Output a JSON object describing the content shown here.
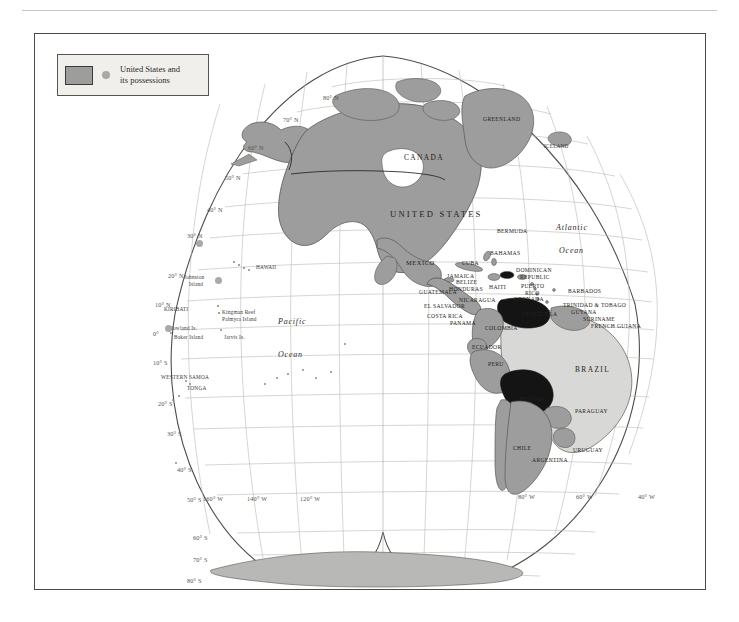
{
  "page": {
    "background": "#ffffff",
    "frame_color": "#4a4a48"
  },
  "legend": {
    "name": "map-legend",
    "swatch_color": "#9d9d9d",
    "dot_color": "#a8a8a8",
    "box_fill": "#f1efec",
    "line1": "United States and",
    "line2": "its possessions"
  },
  "map": {
    "projection": "interrupted-sinusoidal-globe",
    "land_color": "#9d9d9d",
    "land_light_color": "#d8d8d6",
    "highlight_color": "#141414",
    "graticule_color": "#b9b6b1",
    "coast_color": "#5a5753",
    "latitude_labels": [
      {
        "text": "80° N",
        "x": 288,
        "y": 60
      },
      {
        "text": "70° N",
        "x": 248,
        "y": 82
      },
      {
        "text": "60° N",
        "x": 213,
        "y": 110
      },
      {
        "text": "50° N",
        "x": 190,
        "y": 140
      },
      {
        "text": "40° N",
        "x": 172,
        "y": 172
      },
      {
        "text": "30° N",
        "x": 152,
        "y": 198
      },
      {
        "text": "20° N",
        "x": 133,
        "y": 238
      },
      {
        "text": "10° N",
        "x": 120,
        "y": 267
      },
      {
        "text": "0°",
        "x": 118,
        "y": 296
      },
      {
        "text": "10° S",
        "x": 118,
        "y": 325
      },
      {
        "text": "20° S",
        "x": 123,
        "y": 366
      },
      {
        "text": "30° S",
        "x": 132,
        "y": 396
      },
      {
        "text": "40° S",
        "x": 142,
        "y": 432
      },
      {
        "text": "50° S",
        "x": 152,
        "y": 462
      },
      {
        "text": "60° S",
        "x": 158,
        "y": 500
      },
      {
        "text": "70° S",
        "x": 158,
        "y": 522
      },
      {
        "text": "80° S",
        "x": 152,
        "y": 543
      }
    ],
    "longitude_labels": [
      {
        "text": "160° W",
        "x": 168,
        "y": 461
      },
      {
        "text": "140° W",
        "x": 212,
        "y": 461
      },
      {
        "text": "120° W",
        "x": 265,
        "y": 461
      },
      {
        "text": "80° W",
        "x": 483,
        "y": 459
      },
      {
        "text": "60° W",
        "x": 541,
        "y": 459
      },
      {
        "text": "40° W",
        "x": 603,
        "y": 459
      }
    ],
    "ocean_labels": [
      {
        "text": "Pacific",
        "x": 243,
        "y": 283
      },
      {
        "text": "Ocean",
        "x": 243,
        "y": 316
      },
      {
        "text": "Atlantic",
        "x": 521,
        "y": 189
      },
      {
        "text": "Ocean",
        "x": 524,
        "y": 212
      }
    ],
    "country_labels": [
      {
        "text": "CANADA",
        "x": 369,
        "y": 119,
        "style": "country-med"
      },
      {
        "text": "UNITED STATES",
        "x": 355,
        "y": 175,
        "style": "country-big"
      },
      {
        "text": "MEXICO",
        "x": 371,
        "y": 225,
        "style": "country"
      },
      {
        "text": "GREENLAND",
        "x": 448,
        "y": 82,
        "style": "country-sm"
      },
      {
        "text": "ICELAND",
        "x": 509,
        "y": 109,
        "style": "island"
      },
      {
        "text": "BERMUDA",
        "x": 462,
        "y": 194,
        "style": "country-sm"
      },
      {
        "text": "BAHAMAS",
        "x": 455,
        "y": 216,
        "style": "country-sm"
      },
      {
        "text": "CUBA",
        "x": 427,
        "y": 226,
        "style": "country-sm"
      },
      {
        "text": "JAMAICA",
        "x": 412,
        "y": 239,
        "style": "country-sm"
      },
      {
        "text": "BELIZE",
        "x": 421,
        "y": 245,
        "style": "country-sm"
      },
      {
        "text": "HONDURAS",
        "x": 414,
        "y": 252,
        "style": "country-sm"
      },
      {
        "text": "HAITI",
        "x": 454,
        "y": 250,
        "style": "country-sm"
      },
      {
        "text": "DOMINICAN",
        "x": 481,
        "y": 233,
        "style": "country-sm"
      },
      {
        "text": "REPUBLIC",
        "x": 485,
        "y": 240,
        "style": "country-sm"
      },
      {
        "text": "PUERTO",
        "x": 486,
        "y": 249,
        "style": "country-sm"
      },
      {
        "text": "RICO",
        "x": 490,
        "y": 256,
        "style": "country-sm"
      },
      {
        "text": "BARBADOS",
        "x": 533,
        "y": 254,
        "style": "country-sm"
      },
      {
        "text": "GRENADA",
        "x": 479,
        "y": 262,
        "style": "country-sm"
      },
      {
        "text": "TRINIDAD & TOBAGO",
        "x": 528,
        "y": 268,
        "style": "country-sm"
      },
      {
        "text": "GUATEMALA",
        "x": 384,
        "y": 255,
        "style": "country-sm"
      },
      {
        "text": "EL SALVADOR",
        "x": 389,
        "y": 269,
        "style": "country-sm"
      },
      {
        "text": "NICARAGUA",
        "x": 424,
        "y": 263,
        "style": "country-sm"
      },
      {
        "text": "COSTA RICA",
        "x": 392,
        "y": 279,
        "style": "country-sm"
      },
      {
        "text": "PANAMA",
        "x": 415,
        "y": 286,
        "style": "country-sm"
      },
      {
        "text": "VENEZUELA",
        "x": 486,
        "y": 277,
        "style": "country-sm"
      },
      {
        "text": "GUYANA",
        "x": 536,
        "y": 275,
        "style": "country-sm"
      },
      {
        "text": "SURINAME",
        "x": 548,
        "y": 282,
        "style": "country-sm"
      },
      {
        "text": "FRENCH GUIANA",
        "x": 556,
        "y": 289,
        "style": "country-sm"
      },
      {
        "text": "COLOMBIA",
        "x": 450,
        "y": 291,
        "style": "country-sm"
      },
      {
        "text": "ECUADOR",
        "x": 437,
        "y": 310,
        "style": "country-sm"
      },
      {
        "text": "PERU",
        "x": 453,
        "y": 327,
        "style": "country-sm"
      },
      {
        "text": "BRAZIL",
        "x": 540,
        "y": 331,
        "style": "country-med"
      },
      {
        "text": "BOLIVIA",
        "x": 484,
        "y": 362,
        "style": "country-sm"
      },
      {
        "text": "PARAGUAY",
        "x": 540,
        "y": 374,
        "style": "country-sm"
      },
      {
        "text": "CHILE",
        "x": 478,
        "y": 411,
        "style": "country-sm"
      },
      {
        "text": "ARGENTINA",
        "x": 497,
        "y": 423,
        "style": "country-sm"
      },
      {
        "text": "URUGUAY",
        "x": 538,
        "y": 413,
        "style": "country-sm"
      }
    ],
    "island_labels": [
      {
        "text": "HAWAII",
        "x": 221,
        "y": 230
      },
      {
        "text": "Johnston",
        "x": 149,
        "y": 240
      },
      {
        "text": "Island",
        "x": 154,
        "y": 247
      },
      {
        "text": "KIRIBATI",
        "x": 129,
        "y": 272
      },
      {
        "text": "Kingman Reef",
        "x": 187,
        "y": 275
      },
      {
        "text": "Palmyra Island",
        "x": 187,
        "y": 282
      },
      {
        "text": "Howland Is.",
        "x": 134,
        "y": 291
      },
      {
        "text": "Baker Island",
        "x": 139,
        "y": 300
      },
      {
        "text": "Jarvis Is.",
        "x": 189,
        "y": 300
      },
      {
        "text": "WESTERN SAMOA",
        "x": 126,
        "y": 340
      },
      {
        "text": "TONGA",
        "x": 152,
        "y": 351
      }
    ],
    "marker_dots": [
      {
        "x": 161,
        "y": 206
      },
      {
        "x": 180,
        "y": 243
      },
      {
        "x": 130,
        "y": 291
      }
    ]
  }
}
